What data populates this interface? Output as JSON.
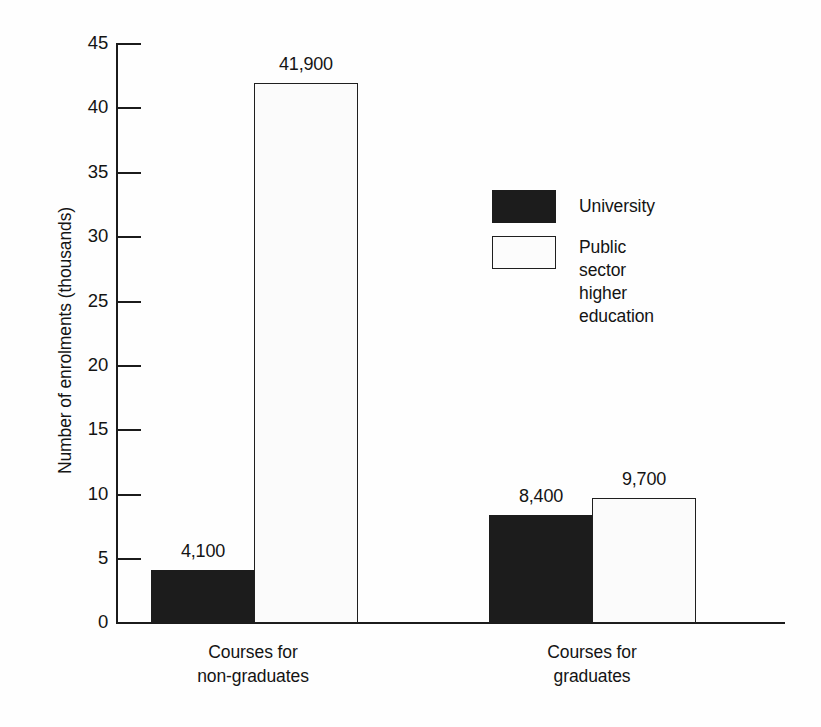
{
  "chart_data": {
    "type": "bar",
    "title": "",
    "subtitle": "",
    "xlabel": "",
    "ylabel": "Number of enrolments (thousands)",
    "ylim": [
      0,
      45
    ],
    "yticks": [
      0,
      5,
      10,
      15,
      20,
      25,
      30,
      35,
      40,
      45
    ],
    "ytick_labels": [
      "0",
      "5",
      "10",
      "15",
      "20",
      "25",
      "30",
      "35",
      "40",
      "45"
    ],
    "grid": false,
    "legend_position": "upper-center-right",
    "categories": [
      "Courses for\nnon-graduates",
      "Courses for\ngraduates"
    ],
    "category_lines": [
      [
        "Courses for",
        "non-graduates"
      ],
      [
        "Courses for",
        "graduates"
      ]
    ],
    "series": [
      {
        "name": "University",
        "color": "#1c1c1c",
        "values": [
          4.1,
          8.4
        ],
        "data_labels": [
          "4,100",
          "8,400"
        ]
      },
      {
        "name": "Public sector\nhigher education",
        "color": "#fbfbfb",
        "edge_color": "#1f1f1f",
        "values": [
          41.9,
          9.7
        ],
        "data_labels": [
          "41,900",
          "9,700"
        ]
      }
    ]
  },
  "axes": {
    "y_title": "Number of enrolments (thousands)",
    "y_tick_labels": [
      "45",
      "40",
      "35",
      "30",
      "25",
      "20",
      "15",
      "10",
      "5",
      "0"
    ]
  },
  "legend": {
    "entries": [
      {
        "label": "University",
        "swatch": "dark"
      },
      {
        "label": "Public sector\nhigher education",
        "swatch": "light"
      }
    ]
  },
  "bars": [
    {
      "group": 0,
      "series": "University",
      "label": "4,100"
    },
    {
      "group": 0,
      "series": "Public sector higher education",
      "label": "41,900"
    },
    {
      "group": 1,
      "series": "University",
      "label": "8,400"
    },
    {
      "group": 1,
      "series": "Public sector higher education",
      "label": "9,700"
    }
  ],
  "category_labels": [
    {
      "line1": "Courses for",
      "line2": "non-graduates"
    },
    {
      "line1": "Courses for",
      "line2": "graduates"
    }
  ]
}
